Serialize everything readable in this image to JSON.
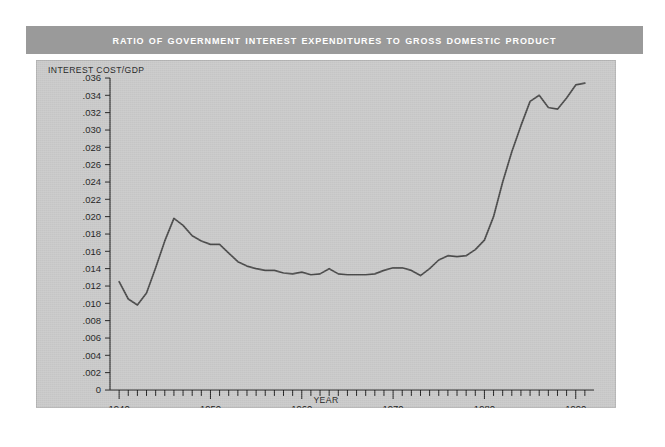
{
  "title": "Ratio of Government Interest Expenditures to Gross Domestic Product",
  "colors": {
    "title_bar": "#9a9a9a",
    "title_text": "#ffffff",
    "panel_bg": "#c9c9c9",
    "line": "#4a4a4a",
    "axis": "#222222",
    "page_bg": "#ffffff"
  },
  "axes": {
    "y_label": "INTEREST COST/GDP",
    "x_label": "YEAR",
    "y_ticks": [
      "0",
      ".002",
      ".004",
      ".006",
      ".008",
      ".010",
      ".012",
      ".014",
      ".016",
      ".018",
      ".020",
      ".022",
      ".024",
      ".026",
      ".028",
      ".030",
      ".032",
      ".034",
      ".036"
    ],
    "x_ticks": [
      "1940",
      "1950",
      "1960",
      "1970",
      "1980",
      "1990"
    ]
  },
  "chart_data": {
    "type": "line",
    "title": "Ratio of Government Interest Expenditures to Gross Domestic Product",
    "xlabel": "YEAR",
    "ylabel": "INTEREST COST/GDP",
    "xlim": [
      1939,
      1992
    ],
    "ylim": [
      0,
      0.036
    ],
    "grid": false,
    "legend": "none",
    "x_tick_interval": 1,
    "x_major_tick_interval": 10,
    "y_tick_interval": 0.002,
    "series": [
      {
        "name": "Interest cost / GDP",
        "x": [
          1940,
          1941,
          1942,
          1943,
          1944,
          1945,
          1946,
          1947,
          1948,
          1949,
          1950,
          1951,
          1952,
          1953,
          1954,
          1955,
          1956,
          1957,
          1958,
          1959,
          1960,
          1961,
          1962,
          1963,
          1964,
          1965,
          1966,
          1967,
          1968,
          1969,
          1970,
          1971,
          1972,
          1973,
          1974,
          1975,
          1976,
          1977,
          1978,
          1979,
          1980,
          1981,
          1982,
          1983,
          1984,
          1985,
          1986,
          1987,
          1988,
          1989,
          1990,
          1991
        ],
        "values": [
          0.0125,
          0.0105,
          0.0098,
          0.0112,
          0.0141,
          0.0172,
          0.0198,
          0.019,
          0.0178,
          0.0172,
          0.0168,
          0.0168,
          0.0158,
          0.0148,
          0.0143,
          0.014,
          0.0138,
          0.0138,
          0.0135,
          0.0134,
          0.0136,
          0.0133,
          0.0134,
          0.014,
          0.0134,
          0.0133,
          0.0133,
          0.0133,
          0.0134,
          0.0138,
          0.0141,
          0.0141,
          0.0138,
          0.0132,
          0.014,
          0.015,
          0.0155,
          0.0154,
          0.0155,
          0.0162,
          0.0173,
          0.02,
          0.024,
          0.0275,
          0.0305,
          0.0333,
          0.034,
          0.0326,
          0.0324,
          0.0337,
          0.0352,
          0.0354
        ]
      }
    ]
  }
}
